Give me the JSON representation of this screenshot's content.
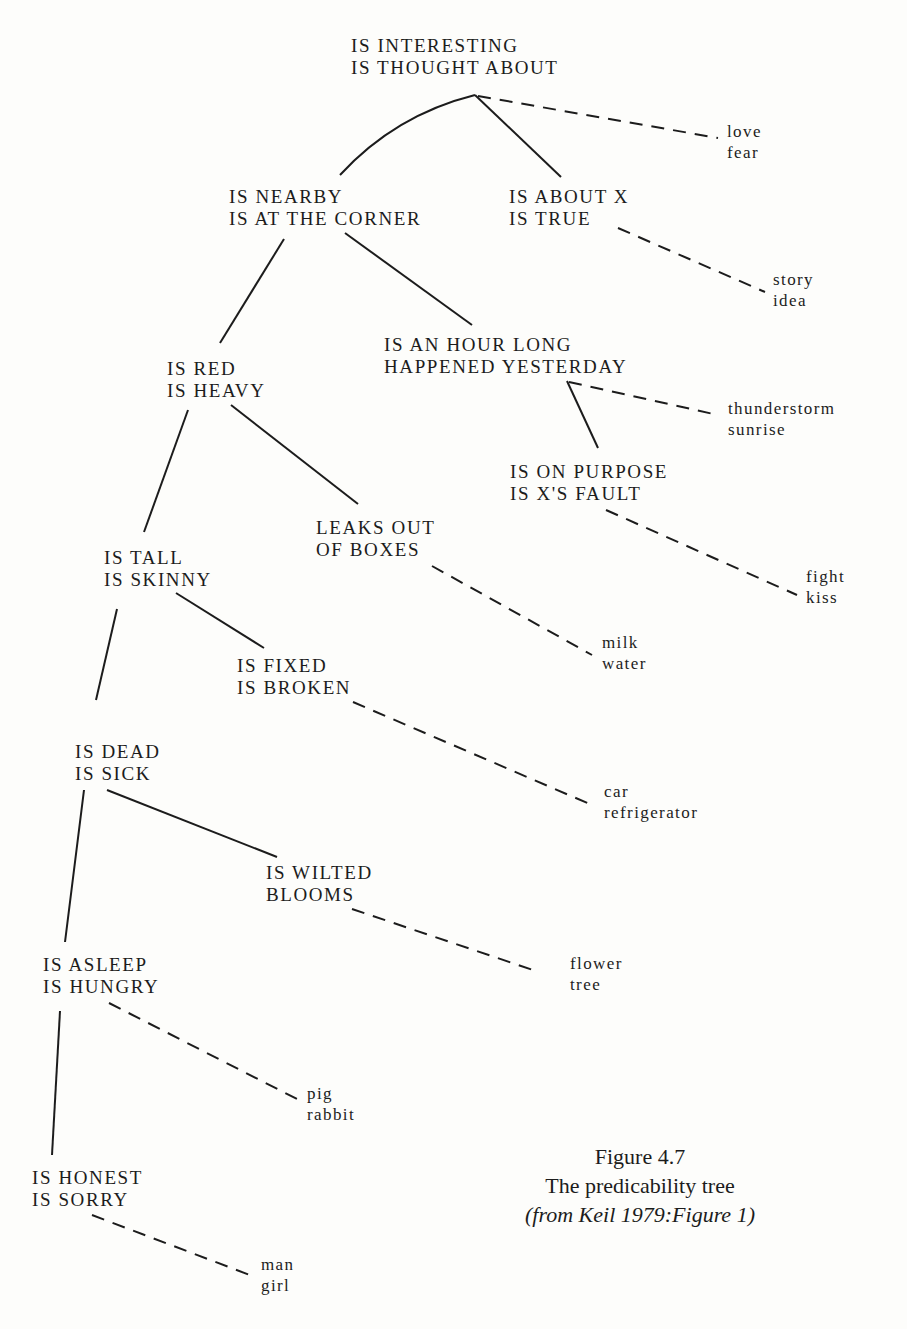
{
  "nodes": [
    {
      "id": "root",
      "lines": [
        "IS INTERESTING",
        "IS THOUGHT ABOUT"
      ],
      "x": 351,
      "y": 35
    },
    {
      "id": "nearby",
      "lines": [
        "IS NEARBY",
        "IS AT THE CORNER"
      ],
      "x": 229,
      "y": 186
    },
    {
      "id": "about",
      "lines": [
        "IS ABOUT X",
        "IS TRUE"
      ],
      "x": 509,
      "y": 186
    },
    {
      "id": "red",
      "lines": [
        "IS RED",
        "IS HEAVY"
      ],
      "x": 167,
      "y": 358
    },
    {
      "id": "hour",
      "lines": [
        "IS AN HOUR LONG",
        "HAPPENED YESTERDAY"
      ],
      "x": 384,
      "y": 334
    },
    {
      "id": "purpose",
      "lines": [
        "IS ON PURPOSE",
        "IS X'S FAULT"
      ],
      "x": 510,
      "y": 461
    },
    {
      "id": "leaks",
      "lines": [
        "LEAKS OUT",
        "OF BOXES"
      ],
      "x": 316,
      "y": 517
    },
    {
      "id": "tall",
      "lines": [
        "IS TALL",
        "IS SKINNY"
      ],
      "x": 104,
      "y": 547
    },
    {
      "id": "fixed",
      "lines": [
        "IS FIXED",
        "IS BROKEN"
      ],
      "x": 237,
      "y": 655
    },
    {
      "id": "dead",
      "lines": [
        "IS DEAD",
        "IS SICK"
      ],
      "x": 75,
      "y": 741
    },
    {
      "id": "wilted",
      "lines": [
        "IS WILTED",
        "BLOOMS"
      ],
      "x": 266,
      "y": 862
    },
    {
      "id": "asleep",
      "lines": [
        "IS ASLEEP",
        "IS HUNGRY"
      ],
      "x": 43,
      "y": 954
    },
    {
      "id": "honest",
      "lines": [
        "IS HONEST",
        "IS SORRY"
      ],
      "x": 32,
      "y": 1167
    }
  ],
  "leaves": [
    {
      "id": "love",
      "words": [
        "love",
        "fear"
      ],
      "x": 727,
      "y": 121
    },
    {
      "id": "story",
      "words": [
        "story",
        "idea"
      ],
      "x": 773,
      "y": 269
    },
    {
      "id": "thunder",
      "words": [
        "thunderstorm",
        "sunrise"
      ],
      "x": 728,
      "y": 398
    },
    {
      "id": "fight",
      "words": [
        "fight",
        "kiss"
      ],
      "x": 806,
      "y": 566
    },
    {
      "id": "milk",
      "words": [
        "milk",
        "water"
      ],
      "x": 602,
      "y": 632
    },
    {
      "id": "car",
      "words": [
        "car",
        "refrigerator"
      ],
      "x": 604,
      "y": 781
    },
    {
      "id": "flower",
      "words": [
        "flower",
        "tree"
      ],
      "x": 570,
      "y": 953
    },
    {
      "id": "pig",
      "words": [
        "pig",
        "rabbit"
      ],
      "x": 307,
      "y": 1083
    },
    {
      "id": "man",
      "words": [
        "man",
        "girl"
      ],
      "x": 261,
      "y": 1254
    }
  ],
  "edges": [
    {
      "type": "solid",
      "d": "M 340 175 Q 395 115 475 95"
    },
    {
      "type": "solid",
      "d": "M 475 95 L 561 177"
    },
    {
      "type": "dashed",
      "d": "M 478 96 L 718 138"
    },
    {
      "type": "solid",
      "d": "M 284 239 L 220 343"
    },
    {
      "type": "solid",
      "d": "M 345 233 L 472 325"
    },
    {
      "type": "dashed",
      "d": "M 618 228 L 765 292"
    },
    {
      "type": "solid",
      "d": "M 567 381 L 598 448"
    },
    {
      "type": "dashed",
      "d": "M 569 382 L 718 415"
    },
    {
      "type": "solid",
      "d": "M 188 410 L 144 532"
    },
    {
      "type": "solid",
      "d": "M 231 405 L 358 504"
    },
    {
      "type": "dashed",
      "d": "M 606 510 L 797 595"
    },
    {
      "type": "dashed",
      "d": "M 432 566 L 592 655"
    },
    {
      "type": "solid",
      "d": "M 117 609 L 96 700"
    },
    {
      "type": "solid",
      "d": "M 176 593 L 264 648"
    },
    {
      "type": "dashed",
      "d": "M 353 702 L 592 805"
    },
    {
      "type": "solid",
      "d": "M 84 790 L 65 942"
    },
    {
      "type": "solid",
      "d": "M 107 790 L 277 857"
    },
    {
      "type": "dashed",
      "d": "M 352 909 L 536 971"
    },
    {
      "type": "solid",
      "d": "M 60 1011 L 52 1155"
    },
    {
      "type": "dashed",
      "d": "M 109 1003 L 297 1099"
    },
    {
      "type": "dashed",
      "d": "M 92 1215 L 255 1277"
    }
  ],
  "caption": {
    "figure": "Figure 4.7",
    "title": "The predicability tree",
    "source": "(from Keil 1979:Figure 1)"
  },
  "colors": {
    "ink": "#1c1c1c",
    "paper": "#fdfdfb"
  }
}
